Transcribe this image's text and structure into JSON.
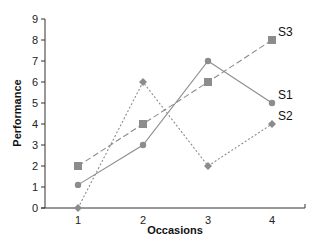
{
  "chart_data": {
    "type": "line",
    "title": "",
    "xlabel": "Occasions",
    "ylabel": "Performance",
    "x": [
      1,
      2,
      3,
      4
    ],
    "categories": [
      "1",
      "2",
      "3",
      "4"
    ],
    "yticks": [
      0,
      1,
      2,
      3,
      4,
      5,
      6,
      7,
      8,
      9
    ],
    "ylim": [
      0,
      9
    ],
    "grid": false,
    "legend": "inline labels at line ends",
    "series": [
      {
        "name": "S1",
        "values": [
          1.1,
          3,
          7,
          5
        ],
        "marker": "circle",
        "line": "solid",
        "color": "#8c8c8c"
      },
      {
        "name": "S2",
        "values": [
          0,
          6,
          2,
          4
        ],
        "marker": "diamond",
        "line": "dotted",
        "color": "#8c8c8c"
      },
      {
        "name": "S3",
        "values": [
          2,
          4,
          6,
          8
        ],
        "marker": "square",
        "line": "dashed",
        "color": "#8c8c8c"
      }
    ]
  },
  "colors": {
    "axis": "#333333",
    "series": "#8c8c8c",
    "text": "#111111"
  }
}
